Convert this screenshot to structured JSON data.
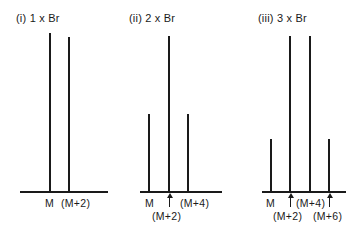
{
  "panels": [
    {
      "title": "(i) 1 x Br",
      "peaks": [
        {
          "label": "M",
          "relative_height": 1.0
        },
        {
          "label": "(M+2)",
          "relative_height": 0.98
        }
      ]
    },
    {
      "title": "(ii) 2 x Br",
      "peaks": [
        {
          "label": "M",
          "relative_height": 0.5
        },
        {
          "label": "(M+2)",
          "relative_height": 1.0
        },
        {
          "label": "(M+4)",
          "relative_height": 0.5
        }
      ]
    },
    {
      "title": "(iii) 3 x Br",
      "peaks": [
        {
          "label": "M",
          "relative_height": 0.34
        },
        {
          "label": "(M+2)",
          "relative_height": 1.0
        },
        {
          "label": "(M+4)",
          "relative_height": 1.0
        },
        {
          "label": "(M+6)",
          "relative_height": 0.34
        }
      ]
    }
  ],
  "colors": {
    "ink": "#1a1a1a",
    "background": "#ffffff"
  }
}
